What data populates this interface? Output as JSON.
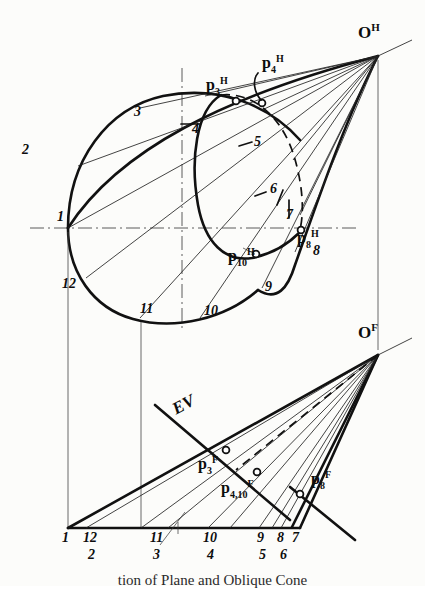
{
  "figure": {
    "caption": "tion of Plane and Oblique Cone",
    "ink_color": "#111111",
    "paper_color": "#fcfcfa",
    "views": {
      "top": {
        "name": "horizontal-view",
        "apex_label": "O",
        "apex_exponent": "H"
      },
      "front": {
        "name": "frontal-view",
        "apex_label": "O",
        "apex_exponent": "F"
      }
    }
  },
  "top_view": {
    "apex": {
      "label": "O",
      "sup": "H",
      "x": 378,
      "y": 56
    },
    "element_numbers": [
      "1",
      "2",
      "3",
      "4",
      "5",
      "6",
      "7",
      "8",
      "9",
      "10",
      "11",
      "12"
    ],
    "number_positions": [
      {
        "n": "1",
        "x": 57,
        "y": 218
      },
      {
        "n": "2",
        "x": 22,
        "y": 150
      },
      {
        "n": "3",
        "x": 134,
        "y": 113
      },
      {
        "n": "4",
        "x": 192,
        "y": 130
      },
      {
        "n": "5",
        "x": 254,
        "y": 143
      },
      {
        "n": "6",
        "x": 270,
        "y": 190
      },
      {
        "n": "7",
        "x": 286,
        "y": 216
      },
      {
        "n": "8",
        "x": 313,
        "y": 252
      },
      {
        "n": "9",
        "x": 265,
        "y": 288
      },
      {
        "n": "10",
        "x": 204,
        "y": 312
      },
      {
        "n": "11",
        "x": 140,
        "y": 310
      },
      {
        "n": "12",
        "x": 62,
        "y": 285
      }
    ],
    "cut_points": [
      {
        "label": "p",
        "sub": "3",
        "sup": "H",
        "x": 213,
        "y": 88
      },
      {
        "label": "p",
        "sub": "4",
        "sup": "H",
        "x": 262,
        "y": 60
      },
      {
        "label": "p",
        "sub": "10",
        "sup": "H",
        "x": 236,
        "y": 254
      },
      {
        "label": "p",
        "sub": "8",
        "sup": "H",
        "x": 297,
        "y": 236
      }
    ]
  },
  "front_view": {
    "apex": {
      "label": "O",
      "sup": "F",
      "x": 378,
      "y": 355
    },
    "edge_view_label": "EV",
    "cut_points": [
      {
        "label": "p",
        "sub": "3",
        "sup": "F",
        "x": 206,
        "y": 463
      },
      {
        "label": "p",
        "sub": "4,10",
        "sup": "F",
        "x": 229,
        "y": 487
      },
      {
        "label": "p",
        "sub": "8",
        "sup": "F",
        "x": 313,
        "y": 478
      }
    ],
    "base_numbers_top_row": [
      "1",
      "12",
      "11",
      "10",
      "9",
      "8",
      "7"
    ],
    "base_numbers_bottom_row": [
      "2",
      "3",
      "4",
      "5",
      "6"
    ],
    "base_top_positions": [
      {
        "n": "1",
        "x": 62,
        "y": 531
      },
      {
        "n": "12",
        "x": 85,
        "y": 531
      },
      {
        "n": "11",
        "x": 152,
        "y": 531
      },
      {
        "n": "10",
        "x": 205,
        "y": 531
      },
      {
        "n": "9",
        "x": 258,
        "y": 531
      },
      {
        "n": "8",
        "x": 280,
        "y": 531
      },
      {
        "n": "7",
        "x": 296,
        "y": 531
      }
    ],
    "base_bottom_positions": [
      {
        "n": "2",
        "x": 89,
        "y": 548
      },
      {
        "n": "3",
        "x": 154,
        "y": 548
      },
      {
        "n": "4",
        "x": 208,
        "y": 548
      },
      {
        "n": "5",
        "x": 260,
        "y": 548
      },
      {
        "n": "6",
        "x": 282,
        "y": 548
      }
    ]
  }
}
